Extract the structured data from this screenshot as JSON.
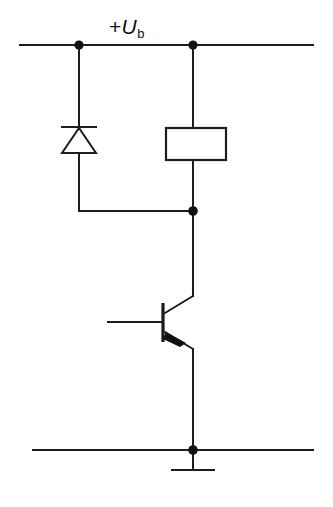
{
  "diagram": {
    "type": "electronic-schematic",
    "background_color": "#ffffff",
    "line_color": "#1c1c1c",
    "labels": {
      "supply_sign": "+",
      "supply_symbol": "U",
      "supply_subscript": "b",
      "supply_full": "+Ub"
    },
    "nodes": [
      {
        "name": "supply-node-diode",
        "x": 79,
        "y": 45
      },
      {
        "name": "supply-node-coil",
        "x": 193,
        "y": 45
      },
      {
        "name": "collector-node",
        "x": 193,
        "y": 211
      },
      {
        "name": "ground-node",
        "x": 193,
        "y": 450
      }
    ],
    "components": [
      {
        "name": "flyback-diode",
        "type": "diode",
        "orientation": "cathode-up"
      },
      {
        "name": "relay-coil",
        "type": "rectangle-coil"
      },
      {
        "name": "transistor",
        "type": "bipolar-transistor",
        "terminals": [
          "base",
          "collector",
          "emitter"
        ]
      },
      {
        "name": "ground",
        "type": "chassis-ground"
      }
    ],
    "rails": [
      {
        "name": "supply-rail",
        "y": 45,
        "x1": 20,
        "x2": 313
      },
      {
        "name": "ground-rail",
        "y": 450,
        "x1": 33,
        "x2": 313
      }
    ]
  }
}
